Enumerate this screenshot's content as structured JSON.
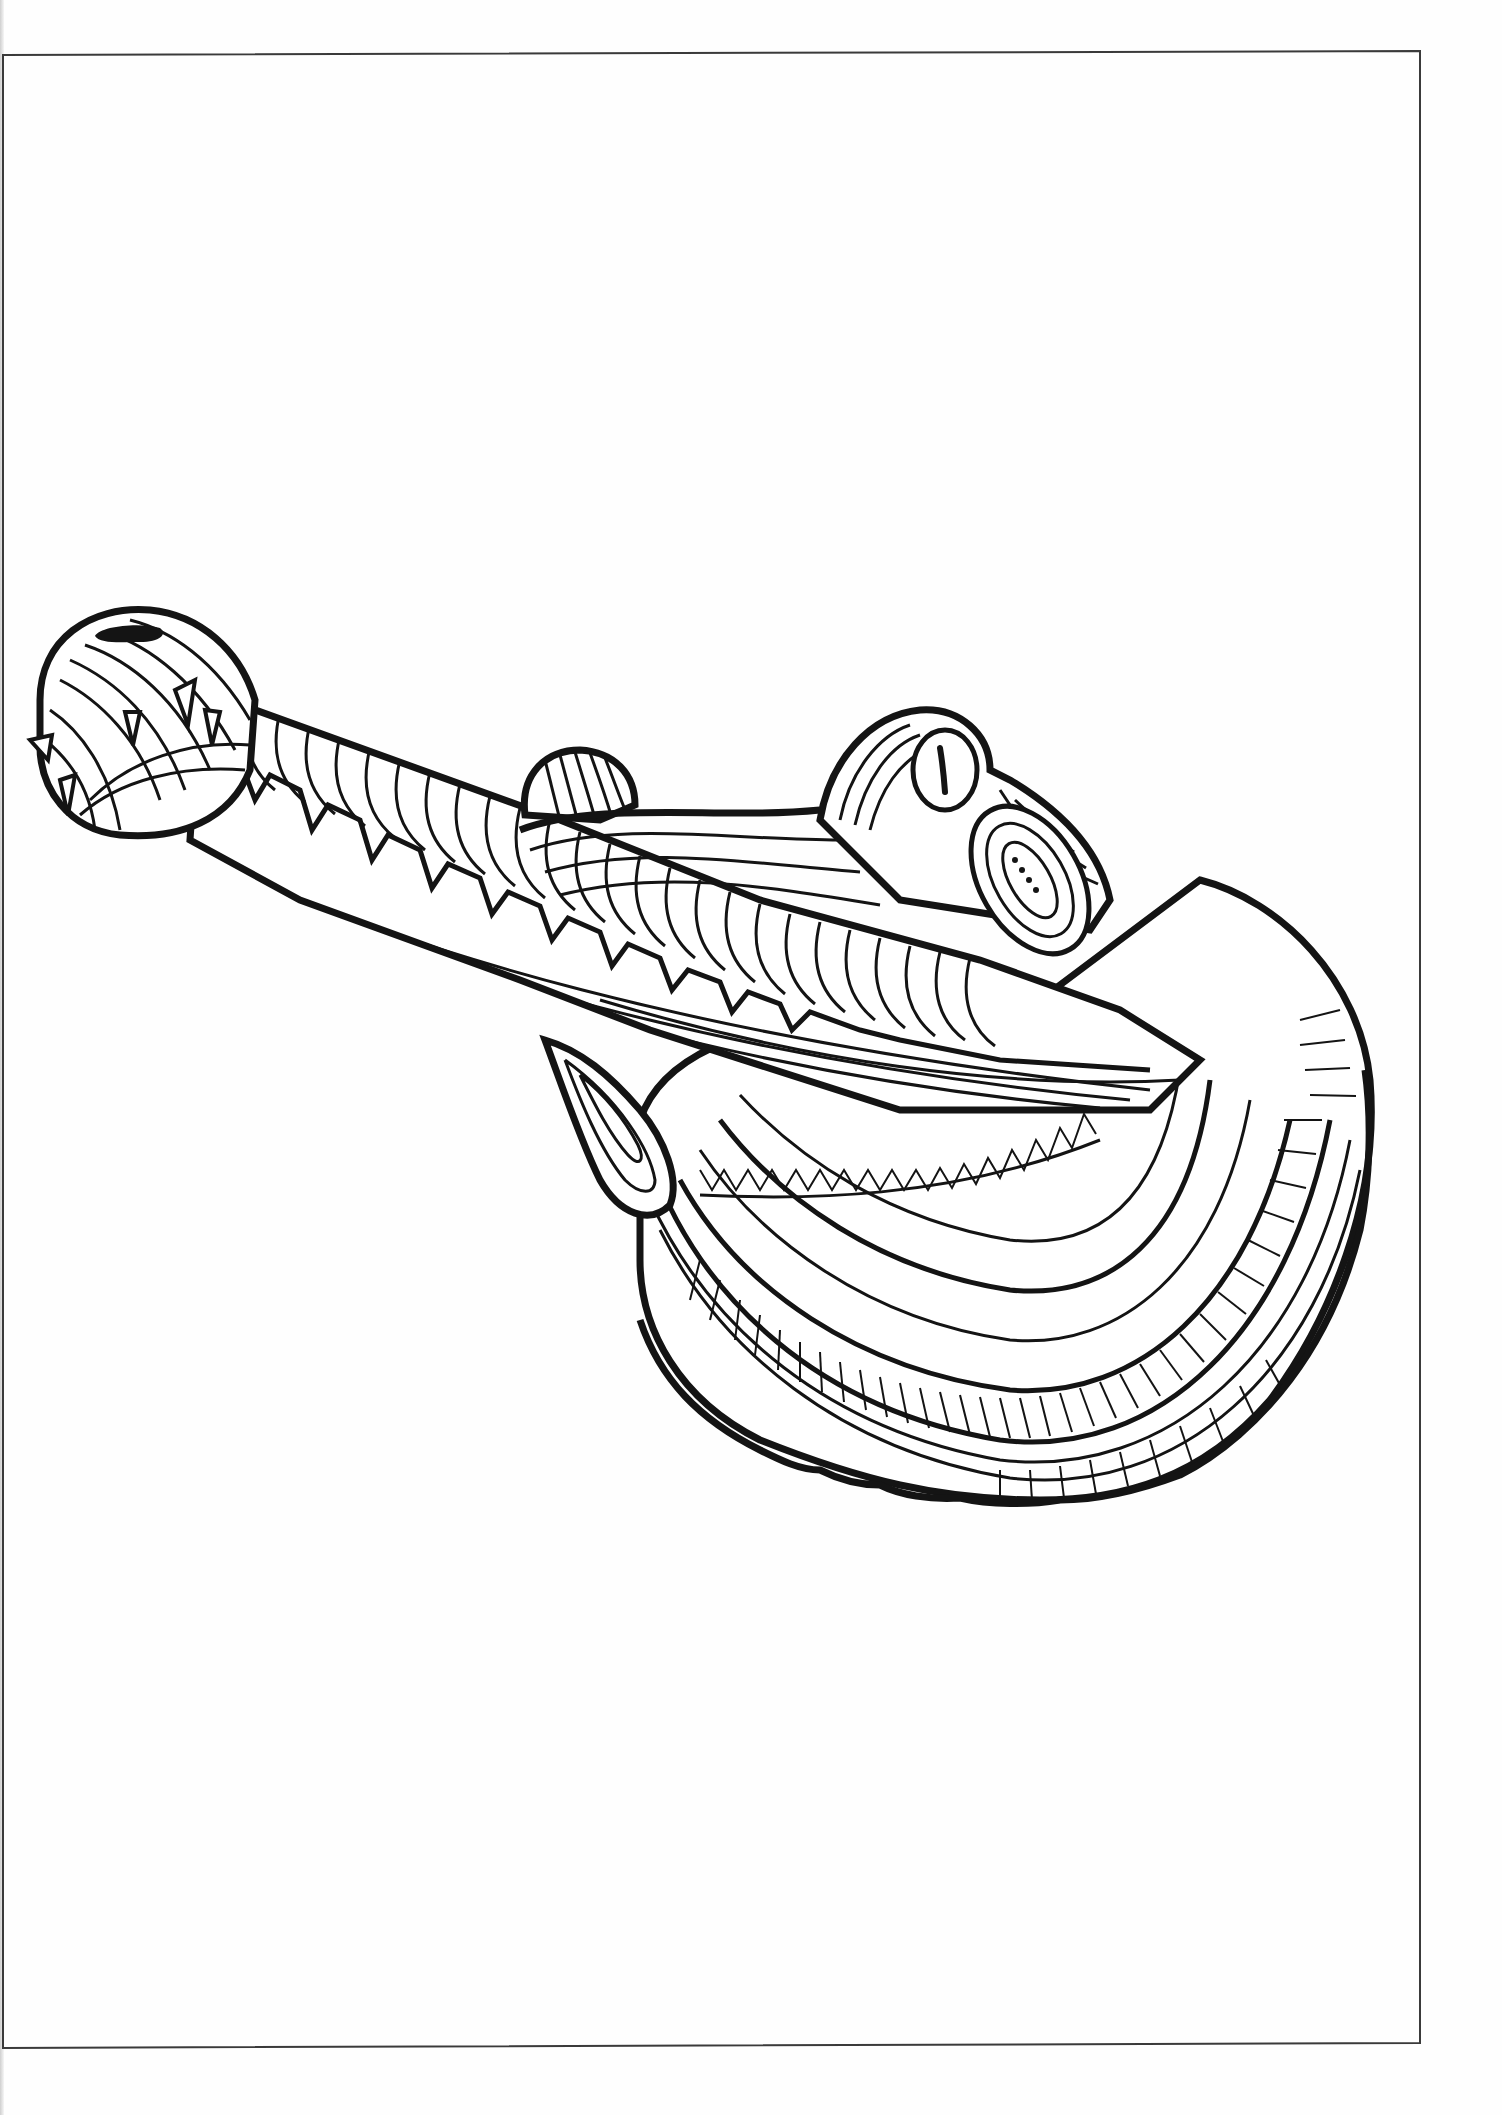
{
  "page": {
    "kind": "coloring-book page",
    "background": "#fefefe",
    "ink": "#141414",
    "frame_color": "#3a3a3a"
  },
  "frame": {
    "top_left": [
      3,
      55
    ],
    "top_right": [
      1420,
      51
    ],
    "bottom_right": [
      1420,
      2043
    ],
    "bottom_left": [
      3,
      2048
    ],
    "stroke_width": 2
  },
  "illustration": {
    "label": "Gharial (line art)",
    "parts": [
      {
        "name": "snout-tip-bulb",
        "center": [
          125,
          760
        ]
      },
      {
        "name": "nostril",
        "center": [
          130,
          633
        ]
      },
      {
        "name": "long-snout",
        "from": [
          190,
          700
        ],
        "to": [
          700,
          1000
        ]
      },
      {
        "name": "small-eye-bump",
        "center": [
          580,
          790
        ]
      },
      {
        "name": "large-eye",
        "center": [
          945,
          770
        ]
      },
      {
        "name": "jaw-fin",
        "center": [
          600,
          1120
        ]
      },
      {
        "name": "neck-shell-lobes",
        "extent": [
          [
            640,
            820
          ],
          [
            1370,
            1500
          ]
        ]
      }
    ]
  }
}
